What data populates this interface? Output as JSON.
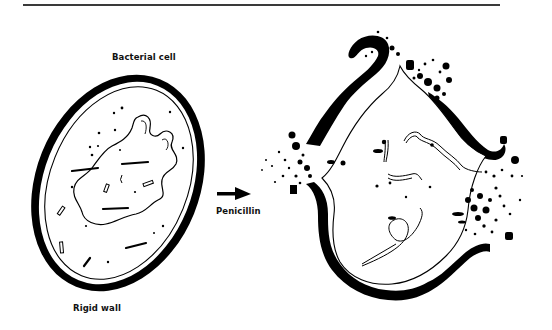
{
  "figure": {
    "labels": {
      "bacterial_cell": "Bacterial cell",
      "penicillin": "Penicillin",
      "rigid_wall": "Rigid wall"
    },
    "panels": [
      {
        "name": "intact-cell",
        "description": "Oval bacterial cell with thick rigid wall, membrane, nucleoid and granules"
      },
      {
        "name": "lysed-cell",
        "description": "Swollen cell with ruptured wall, cytoplasm leaking at breaks"
      }
    ],
    "arrow": {
      "direction": "right",
      "label_ref": "penicillin"
    },
    "colors": {
      "ink": "#000000",
      "background": "#ffffff",
      "rule": "#3a3a3a"
    }
  }
}
